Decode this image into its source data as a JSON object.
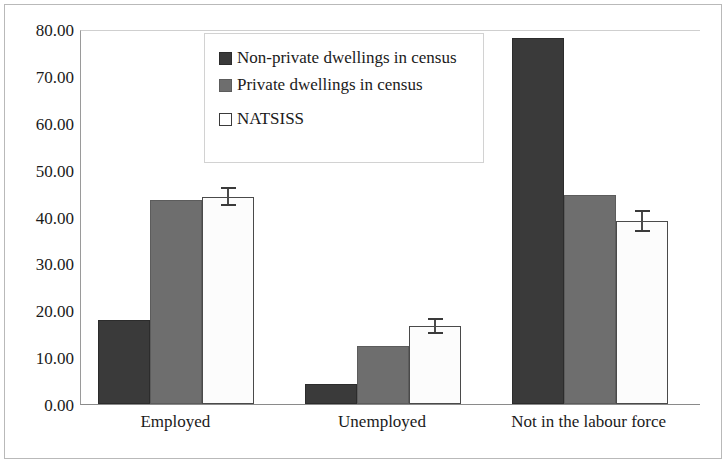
{
  "chart_data": {
    "type": "bar",
    "title": "",
    "xlabel": "",
    "ylabel": "",
    "ylim": [
      0,
      80
    ],
    "ytick_step": 10,
    "grid": false,
    "legend_position": "inside-top-left",
    "categories": [
      "Employed",
      "Unemployed",
      "Not in the labour force"
    ],
    "ytick_labels": [
      "0.00",
      "10.00",
      "20.00",
      "30.00",
      "40.00",
      "50.00",
      "60.00",
      "70.00",
      "80.00"
    ],
    "series": [
      {
        "name": "Non-private dwellings in census",
        "color": "#3a3a3a",
        "values": [
          18.0,
          4.3,
          78.0
        ],
        "errors": [
          null,
          null,
          null
        ]
      },
      {
        "name": "Private dwellings in census",
        "color": "#6e6e6e",
        "values": [
          43.5,
          12.3,
          44.5
        ],
        "errors": [
          null,
          null,
          null
        ]
      },
      {
        "name": "NATSISS",
        "color": "#ffffff",
        "values": [
          44.2,
          16.7,
          39.0
        ],
        "errors": [
          2.0,
          1.7,
          2.4
        ]
      }
    ]
  },
  "legend": {
    "items": [
      {
        "label": "Non-private dwellings in census",
        "swatch": "dark-filled-square"
      },
      {
        "label": "Private dwellings in census",
        "swatch": "gray-filled-square"
      },
      {
        "label": "NATSISS",
        "swatch": "white-outline-square"
      }
    ]
  }
}
